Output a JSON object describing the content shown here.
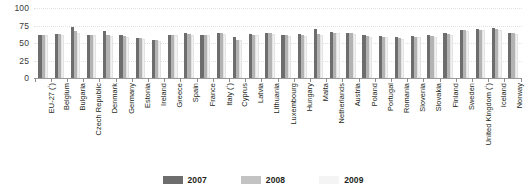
{
  "chart_data": {
    "type": "bar",
    "title": "",
    "xlabel": "",
    "ylabel": "",
    "ylim": [
      0,
      100
    ],
    "yticks": [
      0,
      25,
      50,
      75,
      100
    ],
    "ytick_labels": [
      "0",
      "25",
      "50",
      "75",
      "100"
    ],
    "grid": true,
    "legend_position": "bottom",
    "categories": [
      "EU-27 (¹)",
      "Belgium",
      "Bulgaria",
      "Czech Republic",
      "Denmark",
      "Germany",
      "Estonia",
      "Ireland",
      "Greece",
      "Spain",
      "France",
      "Italy (¹)",
      "Cyprus",
      "Latvia",
      "Lithuania",
      "Luxembourg",
      "Hungary",
      "Malta",
      "Netherlands",
      "Austria",
      "Poland",
      "Portugal",
      "Romania",
      "Slovenia",
      "Slovakia",
      "Finland",
      "Sweden",
      "United Kingdom (¹)",
      "Iceland",
      "Norway"
    ],
    "category_footnotes": [
      "¹",
      "",
      "",
      "",
      "",
      "",
      "",
      "",
      "",
      "",
      "",
      "¹",
      "",
      "",
      "",
      "",
      "",
      "",
      "",
      "",
      "",
      "",
      "",
      "",
      "",
      "",
      "",
      "¹",
      "",
      ""
    ],
    "series": [
      {
        "name": "2007",
        "color": "#6d6d6d",
        "values": [
          62,
          63,
          73,
          62,
          67,
          61,
          57,
          55,
          62,
          64,
          62,
          65,
          58,
          63,
          65,
          61,
          63,
          70,
          66,
          65,
          61,
          60,
          58,
          60,
          61,
          64,
          69,
          70,
          71,
          65
        ]
      },
      {
        "name": "2008",
        "color": "#b3b3b3",
        "values": [
          62,
          63,
          67,
          62,
          61,
          60,
          57,
          54,
          62,
          63,
          62,
          64,
          55,
          62,
          64,
          61,
          61,
          63,
          65,
          64,
          60,
          59,
          57,
          59,
          60,
          63,
          68,
          69,
          70,
          64
        ]
      },
      {
        "name": "2009",
        "color": "#f2f2f2",
        "values": [
          61,
          62,
          65,
          61,
          60,
          59,
          56,
          53,
          61,
          62,
          61,
          63,
          54,
          61,
          63,
          60,
          60,
          62,
          64,
          63,
          59,
          58,
          56,
          58,
          59,
          62,
          67,
          68,
          69,
          63
        ]
      }
    ],
    "legend": [
      {
        "label": "2007",
        "color": "#6d6d6d"
      },
      {
        "label": "2008",
        "color": "#c3c3c3"
      },
      {
        "label": "2009",
        "color": "#f4f4f4"
      }
    ]
  }
}
